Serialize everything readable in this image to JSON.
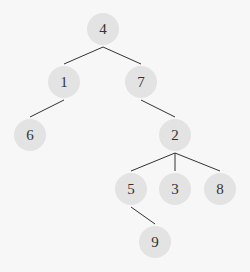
{
  "colors": {
    "background": "#f7f7f7",
    "node_fill": "#e3e3e3",
    "edge": "#333333",
    "text": "#333333"
  },
  "tree": {
    "node_radius": 16,
    "nodes": [
      {
        "id": "n4",
        "label": "4",
        "x": 103,
        "y": 29
      },
      {
        "id": "n1",
        "label": "1",
        "x": 64,
        "y": 82
      },
      {
        "id": "n7",
        "label": "7",
        "x": 141,
        "y": 82
      },
      {
        "id": "n6",
        "label": "6",
        "x": 30,
        "y": 135
      },
      {
        "id": "n2",
        "label": "2",
        "x": 175,
        "y": 135
      },
      {
        "id": "n5",
        "label": "5",
        "x": 131,
        "y": 189
      },
      {
        "id": "n3",
        "label": "3",
        "x": 175,
        "y": 189
      },
      {
        "id": "n8",
        "label": "8",
        "x": 220,
        "y": 189
      },
      {
        "id": "n9",
        "label": "9",
        "x": 155,
        "y": 242
      }
    ],
    "edges": [
      {
        "from": "n4",
        "to": "n1"
      },
      {
        "from": "n4",
        "to": "n7"
      },
      {
        "from": "n1",
        "to": "n6"
      },
      {
        "from": "n7",
        "to": "n2"
      },
      {
        "from": "n2",
        "to": "n5"
      },
      {
        "from": "n2",
        "to": "n3"
      },
      {
        "from": "n2",
        "to": "n8"
      },
      {
        "from": "n5",
        "to": "n9"
      }
    ]
  }
}
